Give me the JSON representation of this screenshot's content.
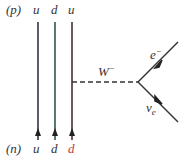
{
  "diagram": {
    "top_hadron": "(p)",
    "bottom_hadron": "(n)",
    "top_quarks": [
      "u",
      "d",
      "u"
    ],
    "bottom_quarks": [
      "u",
      "d",
      "d"
    ],
    "boson": "W",
    "boson_sup": "−",
    "electron": "e",
    "electron_sup": "−",
    "neutrino": "ν",
    "neutrino_sub": "e",
    "colors": {
      "quark1": "#3a2f4a",
      "quark2": "#2f5a45",
      "quark3": "#4a2f3a",
      "bottom_d_label": "#c23a3a",
      "line": "#333333"
    }
  }
}
